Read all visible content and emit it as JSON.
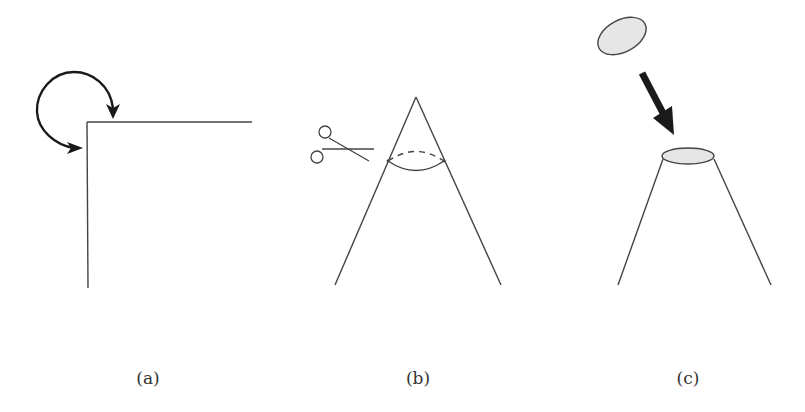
{
  "figure": {
    "panels": [
      {
        "id": "a",
        "caption": "(a)",
        "description": "Right-angle corner with curved arrow indicating rotation/folding"
      },
      {
        "id": "b",
        "caption": "(b)",
        "description": "Cone with scissors cutting off the tip along an ellipse (dashed back edge)"
      },
      {
        "id": "c",
        "caption": "(c)",
        "description": "Truncated cone with a filled elliptical disc being placed onto its top"
      }
    ],
    "icons": {
      "curved_arrow": "curved-arrow-icon",
      "scissors": "scissors-icon",
      "down_arrow": "arrow-down-right-icon"
    },
    "colors": {
      "line": "#444444",
      "arrow": "#1a1a1a",
      "disc_fill": "#e6e6e6",
      "caption": "#333333"
    }
  }
}
